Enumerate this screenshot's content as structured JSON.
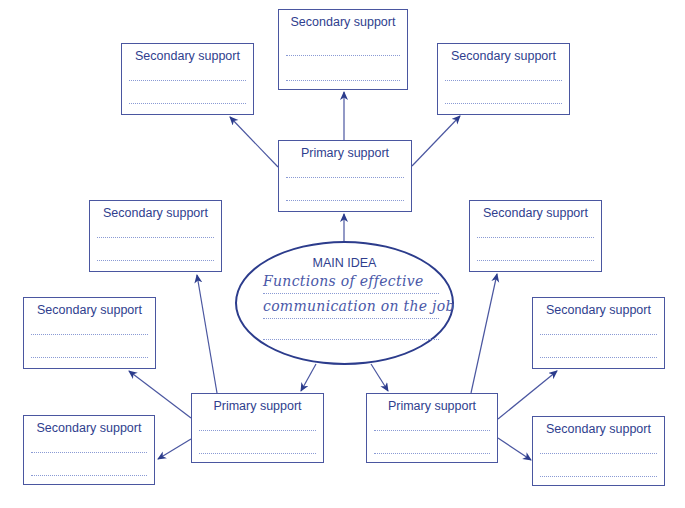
{
  "main_idea": {
    "heading": "MAIN IDEA",
    "text_line_1": "Functions of effective",
    "text_line_2": "communication on the job",
    "text_line_3": ""
  },
  "primary_supports": [
    {
      "id": "top",
      "label": "Primary support"
    },
    {
      "id": "bottom-left",
      "label": "Primary support"
    },
    {
      "id": "bottom-right",
      "label": "Primary support"
    }
  ],
  "secondary_supports": [
    {
      "id": "top-left",
      "label": "Secondary support"
    },
    {
      "id": "top-center",
      "label": "Secondary support"
    },
    {
      "id": "top-right",
      "label": "Secondary support"
    },
    {
      "id": "left-upper",
      "label": "Secondary support"
    },
    {
      "id": "left-middle",
      "label": "Secondary support"
    },
    {
      "id": "left-lower",
      "label": "Secondary support"
    },
    {
      "id": "right-upper",
      "label": "Secondary support"
    },
    {
      "id": "right-middle",
      "label": "Secondary support"
    },
    {
      "id": "right-lower",
      "label": "Secondary support"
    }
  ],
  "colors": {
    "stroke": "#2c3c8c",
    "box_border": "#4a56a0",
    "label_text": "#2f3e8e",
    "handwriting": "#4a58a8",
    "dotted_line": "#8a9ad4",
    "background": "#ffffff"
  }
}
